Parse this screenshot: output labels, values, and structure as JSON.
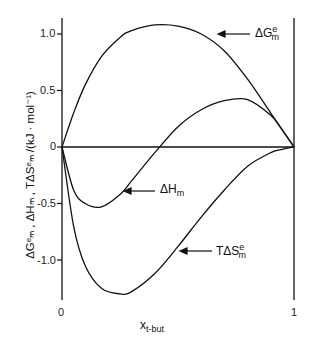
{
  "chart_data": {
    "type": "line",
    "title": "",
    "xlabel": "x_t-but",
    "ylabel": "ΔG^e_m, ΔH_m, TΔS^e_m /(kJ·mol⁻¹)",
    "xlim": [
      0,
      1
    ],
    "ylim": [
      -1.35,
      1.15
    ],
    "x_ticks": [
      "0",
      "1"
    ],
    "y_ticks": [
      "1.0",
      "0.5",
      "0",
      "-0.5",
      "-1.0"
    ],
    "x": [
      0,
      0.05,
      0.1,
      0.17,
      0.25,
      0.3,
      0.4,
      0.5,
      0.6,
      0.7,
      0.8,
      0.9,
      0.95,
      1
    ],
    "series": [
      {
        "name": "ΔG^e_m",
        "values": [
          0,
          0.3,
          0.55,
          0.8,
          0.97,
          1.03,
          1.08,
          1.07,
          1.0,
          0.85,
          0.6,
          0.3,
          0.15,
          0
        ]
      },
      {
        "name": "ΔH_m",
        "values": [
          0,
          -0.38,
          -0.5,
          -0.53,
          -0.42,
          -0.3,
          -0.05,
          0.18,
          0.33,
          0.41,
          0.42,
          0.28,
          0.15,
          0
        ]
      },
      {
        "name": "TΔS^e_m",
        "values": [
          0,
          -0.7,
          -1.05,
          -1.25,
          -1.3,
          -1.28,
          -1.12,
          -0.88,
          -0.62,
          -0.38,
          -0.17,
          -0.05,
          -0.02,
          0
        ]
      }
    ],
    "annotations": [
      "ΔG^e_m",
      "ΔH_m",
      "TΔS^e_m"
    ],
    "grid": false,
    "legend": "arrow labels"
  },
  "labels": {
    "g": "ΔG",
    "g_sup": "e",
    "g_sub": "m",
    "h": "ΔH",
    "h_sub": "m",
    "s": "TΔS",
    "s_sup": "e",
    "s_sub": "m",
    "xlabel": "x",
    "xlabel_sub": "t-but",
    "ylabel": "ΔGᵉₘ , ΔHₘ , TΔSᵉₘ /(kJ · mol⁻¹)"
  }
}
